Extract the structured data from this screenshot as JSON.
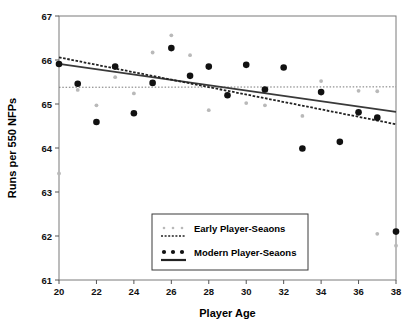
{
  "chart_data": {
    "type": "scatter",
    "title": "",
    "xlabel": "Player  Age",
    "ylabel": "Runs per 550 NFPs",
    "xlim": [
      20,
      38
    ],
    "ylim": [
      61,
      67
    ],
    "xticks": [
      20,
      22,
      24,
      26,
      28,
      30,
      32,
      34,
      36,
      38
    ],
    "yticks": [
      61,
      62,
      63,
      64,
      65,
      66,
      67
    ],
    "grid": false,
    "legend_position": "bottom-center",
    "series": [
      {
        "name": "Early Player-Seaons",
        "marker": "small-dot",
        "color": "#b9b9b9",
        "points": [
          [
            20,
            63.42
          ],
          [
            21,
            65.32
          ],
          [
            22,
            64.97
          ],
          [
            23,
            65.61
          ],
          [
            24,
            65.24
          ],
          [
            25,
            66.17
          ],
          [
            26,
            66.56
          ],
          [
            27,
            66.11
          ],
          [
            28,
            64.86
          ],
          [
            30,
            65.02
          ],
          [
            31,
            64.97
          ],
          [
            33,
            64.73
          ],
          [
            34,
            65.52
          ],
          [
            36,
            65.3
          ],
          [
            37,
            65.29
          ],
          [
            37,
            62.05
          ],
          [
            38,
            61.78
          ]
        ]
      },
      {
        "name": "Modern Player-Seaons",
        "marker": "filled-circle",
        "color": "#111111",
        "points": [
          [
            20,
            65.91
          ],
          [
            21,
            65.46
          ],
          [
            22,
            64.59
          ],
          [
            23,
            65.85
          ],
          [
            24,
            64.79
          ],
          [
            25,
            65.48
          ],
          [
            26,
            66.27
          ],
          [
            27,
            65.64
          ],
          [
            28,
            65.85
          ],
          [
            29,
            65.2
          ],
          [
            30,
            65.89
          ],
          [
            31,
            65.33
          ],
          [
            32,
            65.83
          ],
          [
            33,
            63.99
          ],
          [
            34,
            65.27
          ],
          [
            35,
            64.14
          ],
          [
            36,
            64.81
          ],
          [
            37,
            64.69
          ],
          [
            38,
            62.1
          ]
        ]
      }
    ],
    "trend_lines": [
      {
        "name": "Early Player-Seaons trend",
        "style": "dotted",
        "color": "#777777",
        "from": [
          20,
          65.38
        ],
        "to": [
          38,
          65.39
        ]
      },
      {
        "name": "Modern Player-Seaons trend",
        "style": "solid",
        "color": "#3a3a3a",
        "from": [
          20,
          65.91
        ],
        "to": [
          38,
          64.82
        ]
      },
      {
        "name": "Fitted dashed trend",
        "style": "dashed",
        "color": "#222222",
        "from": [
          20,
          66.06
        ],
        "to": [
          38,
          64.54
        ]
      }
    ]
  },
  "legend": {
    "entries": [
      {
        "label": "Early Player-Seaons",
        "marker": "dotted-dots",
        "line": "dotted"
      },
      {
        "label": "Modern Player-Seaons",
        "marker": "black-dots",
        "line": "solid"
      }
    ]
  },
  "axes": {
    "x_title": "Player  Age",
    "y_title": "Runs per 550 NFPs",
    "x_tick_labels": [
      "20",
      "22",
      "24",
      "26",
      "28",
      "30",
      "32",
      "34",
      "36",
      "38"
    ],
    "y_tick_labels": [
      "61",
      "62",
      "63",
      "64",
      "65",
      "66",
      "67"
    ]
  },
  "colors": {
    "early_marker": "#b9b9b9",
    "modern_marker": "#111111",
    "axis": "#555555",
    "frame": "#7a7a7a",
    "background": "#ffffff"
  }
}
